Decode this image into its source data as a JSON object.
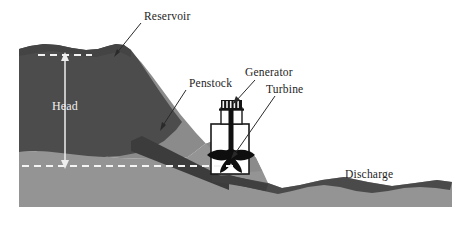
{
  "figure": {
    "width": 475,
    "height": 226,
    "background_color": "#ffffff"
  },
  "labels": {
    "reservoir": "Reservoir",
    "penstock": "Penstock",
    "generator": "Generator",
    "turbine": "Turbine",
    "discharge": "Discharge",
    "head": "Head"
  },
  "colors": {
    "background": "#ffffff",
    "ground_light": "#8c8c8c",
    "ground_mid": "#9a9a9a",
    "hillside": "#8e8e8e",
    "water_dark": "#4a4a4a",
    "water_reservoir": "#4b4b4b",
    "penstock": "#3a3a3a",
    "structure_outline": "#1a1a1a",
    "structure_fill": "#ffffff",
    "machinery_dark": "#111111",
    "dashed_line": "#f2f2f2",
    "arrow_white": "#f0f0f0",
    "label_text": "#1d1d1d",
    "head_text": "#f0f0f0"
  },
  "elements": [
    {
      "name": "reservoir",
      "description": "Impounded water body behind the dam on the upstream left side"
    },
    {
      "name": "head",
      "description": "Vertical white double-headed arrow measuring elevation difference between reservoir surface and tailwater"
    },
    {
      "name": "penstock",
      "description": "Dark inclined conduit carrying water down the hillside to the powerhouse"
    },
    {
      "name": "generator",
      "description": "Finned machine on top of the powerhouse that converts rotation to electricity"
    },
    {
      "name": "turbine",
      "description": "Bladed runner inside the powerhouse driven by the flowing water"
    },
    {
      "name": "discharge",
      "description": "Downstream tailrace channel carrying water away from the plant"
    }
  ],
  "annotations": {
    "upper_water_level": "Reservoir surface dashed level line",
    "lower_water_level": "Tailwater dashed level line"
  }
}
